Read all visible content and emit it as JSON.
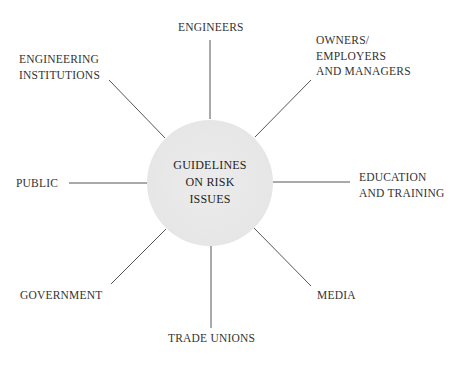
{
  "diagram": {
    "type": "hub-and-spoke",
    "center": {
      "label_lines": [
        "GUIDELINES",
        "ON RISK",
        "ISSUES"
      ]
    },
    "nodes": [
      {
        "id": "engineers",
        "label": "ENGINEERS"
      },
      {
        "id": "owners",
        "label": "OWNERS/\nEMPLOYERS\nAND MANAGERS"
      },
      {
        "id": "education",
        "label": "EDUCATION\nAND TRAINING"
      },
      {
        "id": "media",
        "label": "MEDIA"
      },
      {
        "id": "trade-unions",
        "label": "TRADE UNIONS"
      },
      {
        "id": "government",
        "label": "GOVERNMENT"
      },
      {
        "id": "public",
        "label": "PUBLIC"
      },
      {
        "id": "institutions",
        "label": "ENGINEERING\nINSTITUTIONS"
      }
    ],
    "colors": {
      "hub_fill": "#e8e8e8",
      "line": "#555555",
      "text": "#2a2a2a"
    }
  }
}
